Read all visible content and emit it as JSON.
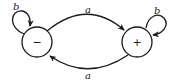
{
  "diagram": {
    "type": "state-transition",
    "states": [
      {
        "id": "minus",
        "label": "−"
      },
      {
        "id": "plus",
        "label": "+"
      }
    ],
    "transitions": [
      {
        "from": "minus",
        "to": "plus",
        "label": "a"
      },
      {
        "from": "plus",
        "to": "minus",
        "label": "a"
      },
      {
        "from": "minus",
        "to": "minus",
        "label": "b"
      },
      {
        "from": "plus",
        "to": "plus",
        "label": "b"
      }
    ]
  }
}
